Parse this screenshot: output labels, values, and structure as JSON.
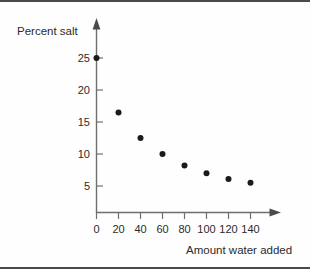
{
  "chart_data": {
    "type": "scatter",
    "title": "",
    "subtitle": "",
    "xlabel": "Amount water added",
    "ylabel": "Percent salt",
    "x": [
      0,
      20,
      40,
      60,
      80,
      100,
      120,
      140
    ],
    "values": [
      25,
      16.5,
      12.5,
      10,
      8.2,
      7,
      6.1,
      5.5
    ],
    "series": [
      {
        "name": "Percent salt",
        "x": [
          0,
          20,
          40,
          60,
          80,
          100,
          120,
          140
        ],
        "values": [
          25,
          16.5,
          12.5,
          10,
          8.2,
          7,
          6.1,
          5.5
        ]
      }
    ],
    "xticks": [
      0,
      20,
      40,
      60,
      80,
      100,
      120,
      140
    ],
    "yticks": [
      5,
      10,
      15,
      20,
      25
    ],
    "xtick_labels": [
      "0",
      "20",
      "40",
      "60",
      "80",
      "100",
      "120",
      "140"
    ],
    "ytick_labels": [
      "5",
      "10",
      "15",
      "20",
      "25"
    ],
    "xlim": [
      0,
      160
    ],
    "ylim": [
      0,
      27.5
    ],
    "grid": false,
    "legend": false,
    "legend_position": "none",
    "marker": "filled-circle",
    "marker_color": "#1a1a1a",
    "axis_color": "#6e6e6e",
    "axis_style": "arrow-tipped",
    "background_color": "#fefefe",
    "annotations": []
  },
  "axes": {
    "y_axis_label": "Percent salt",
    "x_axis_label": "Amount water added"
  }
}
